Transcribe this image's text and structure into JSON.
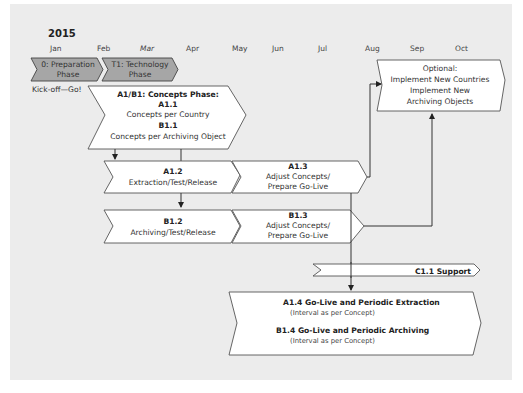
{
  "year": "2015",
  "months": [
    "Jan",
    "Feb",
    "Mar",
    "Apr",
    "May",
    "Jun",
    "Jul",
    "Aug",
    "Sep",
    "Oct"
  ],
  "phases": [
    {
      "line1": "0: Preparation",
      "line2": "Phase"
    },
    {
      "line1": "T1: Technology",
      "line2": "Phase"
    }
  ],
  "kickoff": "Kick-off—Go!",
  "concepts": {
    "title": "A1/B1: Concepts Phase:",
    "a_id": "A1.1",
    "a_text": "Concepts per Country",
    "b_id": "B1.1",
    "b_text": "Concepts per Archiving Object"
  },
  "a12": {
    "id": "A1.2",
    "text": "Extraction/Test/Release"
  },
  "a13": {
    "id": "A1.3",
    "line1": "Adjust Concepts/",
    "line2": "Prepare Go-Live"
  },
  "b12": {
    "id": "B1.2",
    "text": "Archiving/Test/Release"
  },
  "b13": {
    "id": "B1.3",
    "line1": "Adjust Concepts/",
    "line2": "Prepare Go-Live"
  },
  "optional": {
    "line1": "Optional:",
    "line2": "Implement New Countries",
    "line3": "Implement New",
    "line4": "Archiving Objects"
  },
  "support": "C1.1 Support",
  "golive": {
    "a_title": "A1.4 Go-Live and Periodic Extraction",
    "a_note": "(Interval as per Concept)",
    "b_title": "B1.4 Go-Live and Periodic Archiving",
    "b_note": "(Interval as per Concept)"
  },
  "colors": {
    "panel": "#ececec",
    "phase_fill": "#a6a6a6",
    "box_fill": "#ffffff",
    "stroke": "#444444"
  }
}
